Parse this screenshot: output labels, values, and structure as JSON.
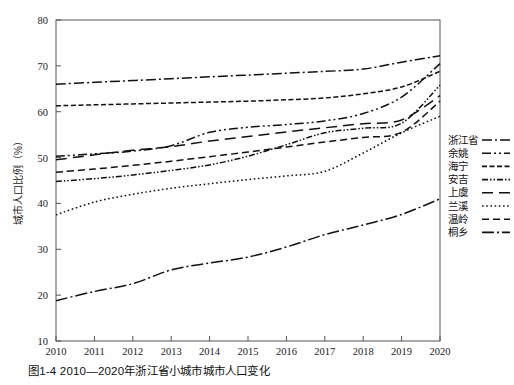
{
  "caption": "图1-4  2010—2020年浙江省小城市城市人口变化",
  "axes": {
    "ylabel": "城市人口比例（%）",
    "xlabel": "",
    "yticks": [
      10,
      20,
      30,
      40,
      50,
      60,
      70,
      80
    ],
    "xticks": [
      "2010",
      "2011",
      "2012",
      "2013",
      "2014",
      "2015",
      "2016",
      "2017",
      "2018",
      "2019",
      "2020"
    ]
  },
  "legend": {
    "position": "right",
    "items": [
      {
        "label": "浙江省",
        "dash": "10,3,2,3"
      },
      {
        "label": "余姚",
        "dash": "9,3,2,3,2,3"
      },
      {
        "label": "海宁",
        "dash": "5,2.5"
      },
      {
        "label": "安吉",
        "dash": "6,2,1.5,2,1.5,2"
      },
      {
        "label": "上虞",
        "dash": "11,6"
      },
      {
        "label": "兰溪",
        "dash": "1.6,2.6"
      },
      {
        "label": "温岭",
        "dash": "7,4"
      },
      {
        "label": "桐乡",
        "dash": "12,3,2,3"
      }
    ]
  },
  "chart_data": {
    "type": "line",
    "title": "图1-4  2010—2020年浙江省小城市城市人口变化",
    "xlabel": "",
    "ylabel": "城市人口比例（%）",
    "xlim": [
      2010,
      2020
    ],
    "ylim": [
      10,
      80
    ],
    "grid": false,
    "x": [
      2010,
      2011,
      2012,
      2013,
      2014,
      2015,
      2016,
      2017,
      2018,
      2019,
      2020
    ],
    "series": [
      {
        "name": "浙江省",
        "values": [
          66.0,
          66.4,
          66.8,
          67.2,
          67.6,
          68.0,
          68.4,
          68.8,
          69.3,
          70.8,
          72.2
        ]
      },
      {
        "name": "余姚",
        "values": [
          50.3,
          50.8,
          51.4,
          52.6,
          55.5,
          56.6,
          57.2,
          58.0,
          59.6,
          63.2,
          70.5
        ]
      },
      {
        "name": "海宁",
        "values": [
          61.3,
          61.5,
          61.7,
          61.9,
          62.1,
          62.3,
          62.6,
          63.0,
          63.9,
          65.4,
          68.8
        ]
      },
      {
        "name": "安吉",
        "values": [
          44.8,
          45.4,
          46.2,
          47.2,
          48.4,
          50.3,
          52.8,
          55.4,
          56.4,
          57.5,
          65.8
        ]
      },
      {
        "name": "上虞",
        "values": [
          49.5,
          50.6,
          51.6,
          52.4,
          53.6,
          54.6,
          55.6,
          56.5,
          57.4,
          58.2,
          63.5
        ]
      },
      {
        "name": "兰溪",
        "values": [
          37.5,
          40.3,
          42.0,
          43.3,
          44.3,
          45.2,
          46.0,
          47.0,
          51.0,
          55.4,
          59.0
        ]
      },
      {
        "name": "温岭",
        "values": [
          46.8,
          47.5,
          48.3,
          49.2,
          50.2,
          51.2,
          52.3,
          53.4,
          54.4,
          55.5,
          62.3
        ]
      },
      {
        "name": "桐乡",
        "values": [
          18.8,
          20.8,
          22.5,
          25.5,
          27.0,
          28.3,
          30.5,
          33.2,
          35.3,
          37.6,
          41.0
        ]
      }
    ]
  }
}
